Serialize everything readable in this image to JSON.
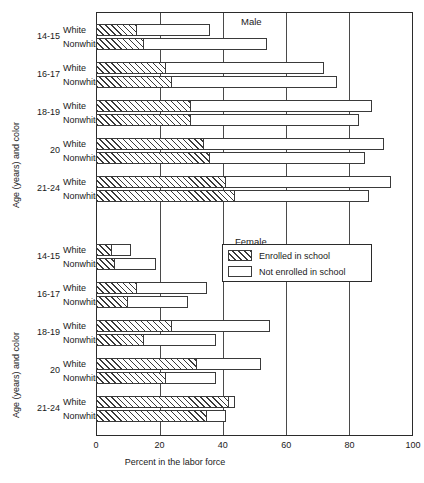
{
  "chart_data": {
    "type": "bar",
    "orientation": "horizontal",
    "stacked": true,
    "title": "",
    "xlabel": "Percent in the labor force",
    "ylabel": "Age (years) and color",
    "xlim": [
      0,
      100
    ],
    "xticks": [
      0,
      20,
      40,
      60,
      80,
      100
    ],
    "grid": true,
    "legend_position": "center-right",
    "series": [
      {
        "name": "Enrolled in school",
        "key": "enrolled",
        "fill": "hatched"
      },
      {
        "name": "Not enrolled in school",
        "key": "not_enrolled",
        "fill": "open"
      }
    ],
    "panels": [
      {
        "label": "Male",
        "ylabel": "Age (years) and color",
        "groups": [
          {
            "age": "14-15",
            "rows": [
              {
                "color": "White",
                "enrolled": 13,
                "total": 36
              },
              {
                "color": "Nonwhite",
                "enrolled": 15,
                "total": 54
              }
            ]
          },
          {
            "age": "16-17",
            "rows": [
              {
                "color": "White",
                "enrolled": 22,
                "total": 72
              },
              {
                "color": "Nonwhite",
                "enrolled": 24,
                "total": 76
              }
            ]
          },
          {
            "age": "18-19",
            "rows": [
              {
                "color": "White",
                "enrolled": 30,
                "total": 87
              },
              {
                "color": "Nonwhite",
                "enrolled": 30,
                "total": 83
              }
            ]
          },
          {
            "age": "20",
            "rows": [
              {
                "color": "White",
                "enrolled": 34,
                "total": 91
              },
              {
                "color": "Nonwhite",
                "enrolled": 36,
                "total": 85
              }
            ]
          },
          {
            "age": "21-24",
            "rows": [
              {
                "color": "White",
                "enrolled": 41,
                "total": 93
              },
              {
                "color": "Nonwhite",
                "enrolled": 44,
                "total": 86
              }
            ]
          }
        ]
      },
      {
        "label": "Female",
        "ylabel": "Age (years) and color",
        "groups": [
          {
            "age": "14-15",
            "rows": [
              {
                "color": "White",
                "enrolled": 5,
                "total": 11
              },
              {
                "color": "Nonwhite",
                "enrolled": 6,
                "total": 19
              }
            ]
          },
          {
            "age": "16-17",
            "rows": [
              {
                "color": "White",
                "enrolled": 13,
                "total": 35
              },
              {
                "color": "Nonwhite",
                "enrolled": 10,
                "total": 29
              }
            ]
          },
          {
            "age": "18-19",
            "rows": [
              {
                "color": "White",
                "enrolled": 24,
                "total": 55
              },
              {
                "color": "Nonwhite",
                "enrolled": 15,
                "total": 38
              }
            ]
          },
          {
            "age": "20",
            "rows": [
              {
                "color": "White",
                "enrolled": 32,
                "total": 52
              },
              {
                "color": "Nonwhite",
                "enrolled": 22,
                "total": 38
              }
            ]
          },
          {
            "age": "21-24",
            "rows": [
              {
                "color": "White",
                "enrolled": 42,
                "total": 44
              },
              {
                "color": "Nonwhite",
                "enrolled": 35,
                "total": 41
              }
            ]
          }
        ]
      }
    ],
    "colors": {
      "line": "#3a3a3a",
      "frame": "#2b2b2b",
      "grid": "#4a4a4a",
      "background": "#ffffff"
    }
  }
}
